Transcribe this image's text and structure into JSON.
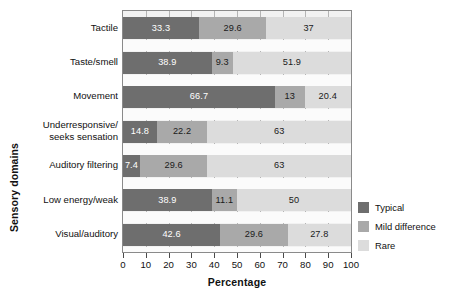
{
  "figure": {
    "yaxis_title": "Sensory domains",
    "xaxis_title": "Percentage",
    "watermark": ""
  },
  "legend": {
    "items": [
      {
        "label": "Typical",
        "color": "#6e6e6e",
        "key": "typical"
      },
      {
        "label": "Mild difference",
        "color": "#a9a9a9",
        "key": "mild"
      },
      {
        "label": "Rare",
        "color": "#dcdcdc",
        "key": "rare"
      }
    ]
  },
  "xticks": [
    "0",
    "10",
    "20",
    "30",
    "40",
    "50",
    "60",
    "70",
    "80",
    "90",
    "100"
  ],
  "rows": [
    {
      "label": "Tactile",
      "label_lines": [
        "Tactile"
      ],
      "segments": [
        {
          "series": "Typical",
          "value": 33.3,
          "display": "33.3",
          "color": "#6e6e6e",
          "text_color": "light"
        },
        {
          "series": "Mild difference",
          "value": 29.6,
          "display": "29.6",
          "color": "#a9a9a9",
          "text_color": "dark"
        },
        {
          "series": "Rare",
          "value": 37,
          "display": "37",
          "color": "#dcdcdc",
          "text_color": "dark"
        }
      ]
    },
    {
      "label": "Taste/smell",
      "label_lines": [
        "Taste/smell"
      ],
      "segments": [
        {
          "series": "Typical",
          "value": 38.9,
          "display": "38.9",
          "color": "#6e6e6e",
          "text_color": "light"
        },
        {
          "series": "Mild difference",
          "value": 9.3,
          "display": "9.3",
          "color": "#a9a9a9",
          "text_color": "dark"
        },
        {
          "series": "Rare",
          "value": 51.9,
          "display": "51.9",
          "color": "#dcdcdc",
          "text_color": "dark"
        }
      ]
    },
    {
      "label": "Movement",
      "label_lines": [
        "Movement"
      ],
      "segments": [
        {
          "series": "Typical",
          "value": 66.7,
          "display": "66.7",
          "color": "#6e6e6e",
          "text_color": "light"
        },
        {
          "series": "Mild difference",
          "value": 13,
          "display": "13",
          "color": "#a9a9a9",
          "text_color": "dark"
        },
        {
          "series": "Rare",
          "value": 20.4,
          "display": "20.4",
          "color": "#dcdcdc",
          "text_color": "dark"
        }
      ]
    },
    {
      "label": "Underresponsive/ seeks sensation",
      "label_lines": [
        "Underresponsive/",
        "seeks sensation"
      ],
      "segments": [
        {
          "series": "Typical",
          "value": 14.8,
          "display": "14.8",
          "color": "#6e6e6e",
          "text_color": "light"
        },
        {
          "series": "Mild difference",
          "value": 22.2,
          "display": "22.2",
          "color": "#a9a9a9",
          "text_color": "dark"
        },
        {
          "series": "Rare",
          "value": 63,
          "display": "63",
          "color": "#dcdcdc",
          "text_color": "dark"
        }
      ]
    },
    {
      "label": "Auditory filtering",
      "label_lines": [
        "Auditory filtering"
      ],
      "segments": [
        {
          "series": "Typical",
          "value": 7.4,
          "display": "7.4",
          "color": "#6e6e6e",
          "text_color": "light"
        },
        {
          "series": "Mild difference",
          "value": 29.6,
          "display": "29.6",
          "color": "#a9a9a9",
          "text_color": "dark"
        },
        {
          "series": "Rare",
          "value": 63,
          "display": "63",
          "color": "#dcdcdc",
          "text_color": "dark"
        }
      ]
    },
    {
      "label": "Low energy/weak",
      "label_lines": [
        "Low energy/weak"
      ],
      "segments": [
        {
          "series": "Typical",
          "value": 38.9,
          "display": "38.9",
          "color": "#6e6e6e",
          "text_color": "light"
        },
        {
          "series": "Mild difference",
          "value": 11.1,
          "display": "11.1",
          "color": "#a9a9a9",
          "text_color": "dark"
        },
        {
          "series": "Rare",
          "value": 50,
          "display": "50",
          "color": "#dcdcdc",
          "text_color": "dark"
        }
      ]
    },
    {
      "label": "Visual/auditory",
      "label_lines": [
        "Visual/auditory"
      ],
      "segments": [
        {
          "series": "Typical",
          "value": 42.6,
          "display": "42.6",
          "color": "#6e6e6e",
          "text_color": "light"
        },
        {
          "series": "Mild difference",
          "value": 29.6,
          "display": "29.6",
          "color": "#a9a9a9",
          "text_color": "dark"
        },
        {
          "series": "Rare",
          "value": 27.8,
          "display": "27.8",
          "color": "#dcdcdc",
          "text_color": "dark"
        }
      ]
    }
  ],
  "chart_data": {
    "type": "bar",
    "orientation": "horizontal",
    "stacked": true,
    "stack_mode": "percent",
    "title": "",
    "xlabel": "Percentage",
    "ylabel": "Sensory domains",
    "xlim": [
      0,
      100
    ],
    "xticks": [
      0,
      10,
      20,
      30,
      40,
      50,
      60,
      70,
      80,
      90,
      100
    ],
    "grid": true,
    "grid_axis": "x",
    "legend_position": "right",
    "categories": [
      "Tactile",
      "Taste/smell",
      "Movement",
      "Underresponsive/ seeks sensation",
      "Auditory filtering",
      "Low energy/weak",
      "Visual/auditory"
    ],
    "series": [
      {
        "name": "Typical",
        "color": "#6e6e6e",
        "values": [
          33.3,
          38.9,
          66.7,
          14.8,
          7.4,
          38.9,
          42.6
        ]
      },
      {
        "name": "Mild difference",
        "color": "#a9a9a9",
        "values": [
          29.6,
          9.3,
          13,
          22.2,
          29.6,
          11.1,
          29.6
        ]
      },
      {
        "name": "Rare",
        "color": "#dcdcdc",
        "values": [
          37,
          51.9,
          20.4,
          63,
          63,
          50,
          27.8
        ]
      }
    ]
  }
}
